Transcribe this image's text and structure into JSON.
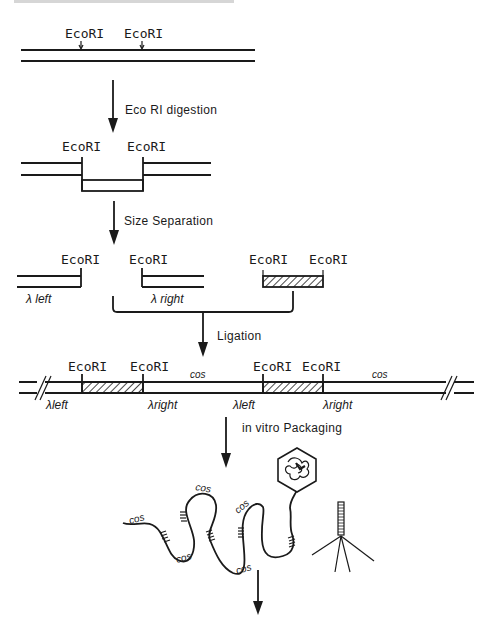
{
  "diagram": {
    "colors": {
      "ink": "#1a1a1a",
      "background": "#ffffff"
    },
    "stage1": {
      "site_labels": [
        "EcoRI",
        "EcoRI"
      ]
    },
    "step1": {
      "label": "Eco RI digestion"
    },
    "stage2": {
      "site_labels": [
        "EcoRI",
        "EcoRI"
      ]
    },
    "step2": {
      "label": "Size Separation"
    },
    "stage3": {
      "site_labels": [
        "EcoRI",
        "EcoRI",
        "EcoRI",
        "EcoRI"
      ],
      "arm_labels": [
        "λ left",
        "λ right"
      ]
    },
    "step3": {
      "label": "Ligation"
    },
    "stage4": {
      "site_labels": [
        "EcoRI",
        "EcoRI",
        "EcoRI",
        "EcoRI"
      ],
      "cos_labels": [
        "cos",
        "cos"
      ],
      "arm_labels": [
        "λleft",
        "λright",
        "λleft",
        "λright"
      ]
    },
    "step4": {
      "label": "in vitro Packaging"
    },
    "stage5": {
      "cos_labels": [
        "cos",
        "cos",
        "cos",
        "cos",
        "cos"
      ]
    }
  }
}
